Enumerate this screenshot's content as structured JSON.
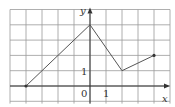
{
  "chart_data": {
    "type": "line",
    "title": "",
    "xlabel": "x",
    "ylabel": "y",
    "origin_label": "0",
    "x_tick_label": "1",
    "y_tick_label": "1",
    "xlim": [
      -5,
      5
    ],
    "ylim": [
      -1,
      5
    ],
    "grid": true,
    "series": [
      {
        "name": "f",
        "x": [
          -4,
          0,
          2,
          4
        ],
        "y": [
          0,
          4,
          1,
          2
        ]
      }
    ],
    "endpoints": [
      [
        -4,
        0
      ],
      [
        4,
        2
      ]
    ]
  },
  "colors": {
    "grid": "#9a9a9a",
    "axis": "#333333",
    "line": "#555555"
  }
}
